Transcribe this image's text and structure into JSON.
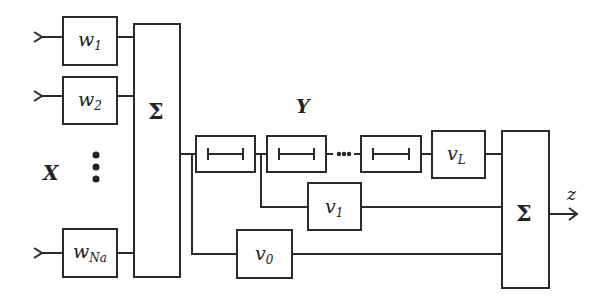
{
  "diagram": {
    "input_label": "X",
    "delay_line_label": "Y",
    "output_label": "z",
    "input_weights": [
      {
        "main": "w",
        "sub": "1"
      },
      {
        "main": "w",
        "sub": "2"
      },
      {
        "main": "w",
        "sub": "Na"
      }
    ],
    "input_sum_label": "Σ",
    "output_sum_label": "Σ",
    "tap_weights": [
      {
        "main": "v",
        "sub": "0"
      },
      {
        "main": "v",
        "sub": "1"
      },
      {
        "main": "v",
        "sub": "L"
      }
    ],
    "delay_elements": 3,
    "ellipsis": "•••",
    "colors": {
      "stroke": "#2a2a2a",
      "background": "#ffffff"
    }
  }
}
